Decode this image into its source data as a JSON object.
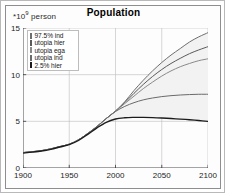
{
  "figure": {
    "title": "Population",
    "ylabel_prefix": "*10",
    "ylabel_exp": "9",
    "ylabel_suffix": " person"
  },
  "legend": {
    "items": [
      {
        "label": "97.5% ind",
        "color": "#6e6e6e"
      },
      {
        "label": "utopia hier",
        "color": "#5a5a5a"
      },
      {
        "label": "utopia ega",
        "color": "#8a8a8a"
      },
      {
        "label": "utopia ind",
        "color": "#6a6a6a"
      },
      {
        "label": "2.5% hier",
        "color": "#1c1c1c"
      }
    ]
  },
  "axes": {
    "yticks": [
      "0",
      "5",
      "10",
      "15"
    ],
    "xticks": [
      "1900",
      "1950",
      "2000",
      "2050",
      "2100"
    ]
  },
  "chart_data": {
    "type": "line",
    "title": "Population",
    "xlabel": "",
    "ylabel": "*10^9 person",
    "xlim": [
      1900,
      2100
    ],
    "ylim": [
      0,
      15
    ],
    "xticks": [
      1900,
      1950,
      2000,
      2050,
      2100
    ],
    "yticks": [
      0,
      5,
      10,
      15
    ],
    "grid": true,
    "legend_position": "upper-left",
    "units": "billions of persons",
    "x": [
      1900,
      1910,
      1920,
      1930,
      1940,
      1950,
      1960,
      1970,
      1980,
      1990,
      2000,
      2010,
      2020,
      2030,
      2040,
      2050,
      2060,
      2070,
      2080,
      2090,
      2100
    ],
    "series": [
      {
        "name": "97.5% ind",
        "color": "#6e6e6e",
        "values": [
          1.65,
          1.75,
          1.86,
          2.05,
          2.3,
          2.55,
          3.02,
          3.7,
          4.45,
          5.3,
          6.1,
          7.1,
          8.3,
          9.4,
          10.4,
          11.3,
          12.1,
          12.8,
          13.5,
          14.05,
          14.5
        ]
      },
      {
        "name": "utopia hier",
        "color": "#5a5a5a",
        "values": [
          1.65,
          1.75,
          1.86,
          2.05,
          2.3,
          2.55,
          3.02,
          3.7,
          4.45,
          5.3,
          6.1,
          7.0,
          8.0,
          8.95,
          9.8,
          10.55,
          11.2,
          11.75,
          12.25,
          12.65,
          13.0
        ]
      },
      {
        "name": "utopia ega",
        "color": "#8a8a8a",
        "values": [
          1.65,
          1.75,
          1.86,
          2.05,
          2.3,
          2.55,
          3.02,
          3.7,
          4.45,
          5.3,
          6.1,
          6.9,
          7.7,
          8.5,
          9.2,
          9.85,
          10.4,
          10.85,
          11.2,
          11.5,
          11.7
        ]
      },
      {
        "name": "utopia ind",
        "color": "#6a6a6a",
        "values": [
          1.65,
          1.75,
          1.86,
          2.05,
          2.3,
          2.55,
          3.02,
          3.7,
          4.45,
          5.3,
          6.05,
          6.6,
          7.0,
          7.3,
          7.5,
          7.65,
          7.75,
          7.82,
          7.87,
          7.9,
          7.9
        ]
      },
      {
        "name": "2.5% hier",
        "color": "#1c1c1c",
        "values": [
          1.6,
          1.7,
          1.82,
          2.0,
          2.25,
          2.5,
          2.95,
          3.6,
          4.3,
          4.9,
          5.25,
          5.38,
          5.42,
          5.42,
          5.4,
          5.36,
          5.3,
          5.24,
          5.17,
          5.09,
          5.0
        ]
      }
    ]
  }
}
